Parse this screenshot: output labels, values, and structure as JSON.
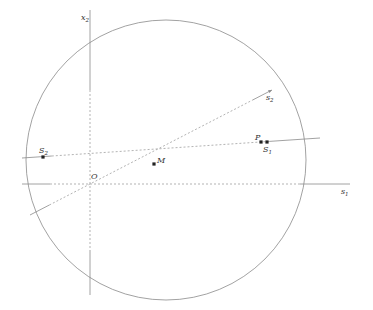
{
  "diagram": {
    "title": "",
    "circle": {
      "cx": 166,
      "cy": 160,
      "r": 140,
      "stroke": "#8a8a8a"
    },
    "axes": {
      "x1": {
        "label": "s",
        "sub": "1",
        "y": 184,
        "x_start": 22,
        "x_end": 350,
        "dashed_from": 50,
        "dashed_to": 300,
        "label_x": 341,
        "label_y": 194
      },
      "x2": {
        "label": "x",
        "sub": "2",
        "x": 90,
        "y_start": 10,
        "y_end": 295,
        "dashed_from": 90,
        "dashed_to": 250,
        "label_x": 81,
        "label_y": 20
      }
    },
    "lines": [
      {
        "name": "line-s2-horizontal",
        "x1": 22,
        "y1": 158,
        "x2": 320,
        "y2": 138,
        "dashed_from_t": 0.1,
        "dashed_to_t": 0.83
      },
      {
        "name": "line-diagonal-s2",
        "x1": 30,
        "y1": 215,
        "x2": 272,
        "y2": 90,
        "dashed_from_t": 0.08,
        "dashed_to_t": 0.92
      }
    ],
    "points": [
      {
        "name": "S2",
        "label": "S",
        "sub": "2",
        "x": 43,
        "y": 157,
        "label_x": 39,
        "label_y": 153
      },
      {
        "name": "P",
        "label": "P",
        "sub": "",
        "x": 261,
        "y": 142,
        "label_x": 255,
        "label_y": 140
      },
      {
        "name": "S1",
        "label": "S",
        "sub": "1",
        "x": 267,
        "y": 142,
        "label_x": 263,
        "label_y": 152
      },
      {
        "name": "M",
        "label": "M",
        "sub": "",
        "x": 154,
        "y": 164,
        "label_x": 157,
        "label_y": 163
      }
    ],
    "labels": [
      {
        "name": "origin-label",
        "text": "O",
        "sub": "",
        "x": 91,
        "y": 179
      },
      {
        "name": "s2-line-label",
        "text": "s",
        "sub": "2",
        "x": 266,
        "y": 100
      }
    ],
    "colors": {
      "line": "#8a8a8a",
      "dashed": "#aaaaaa",
      "point": "#222222",
      "text": "#333333"
    }
  }
}
